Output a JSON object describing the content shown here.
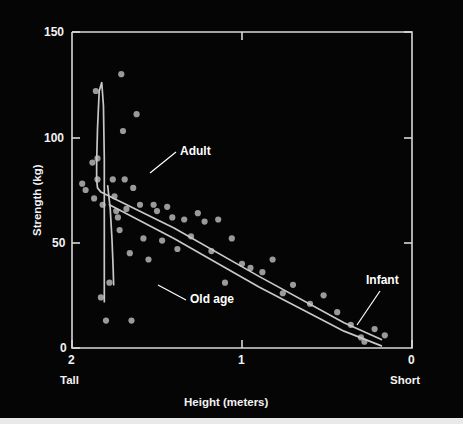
{
  "figure": {
    "background_color": "#050505",
    "ink_color": "#d8d8d8",
    "point_color": "#9a9a9a",
    "label_color": "#ffffff"
  },
  "axes": {
    "y_title": "Strength (kg)",
    "x_title": "Height (meters)",
    "y_ticks": [
      "0",
      "50",
      "100",
      "150"
    ],
    "x_ticks": [
      "2",
      "1",
      "0"
    ],
    "x_left_word": "Tall",
    "x_right_word": "Short"
  },
  "annotations": {
    "adult": "Adult",
    "old_age": "Old age",
    "infant": "Infant"
  },
  "chart_data": {
    "type": "scatter",
    "title": "",
    "xlabel": "Height (meters)",
    "ylabel": "Strength (kg)",
    "xlim": [
      2,
      0
    ],
    "ylim": [
      0,
      150
    ],
    "x_axis_reversed": true,
    "xticks": [
      2,
      1,
      0
    ],
    "yticks": [
      0,
      50,
      100,
      150
    ],
    "xtick_end_labels": {
      "left": "Tall",
      "right": "Short"
    },
    "grid": false,
    "legend": "none",
    "annotations": [
      {
        "text": "Adult",
        "x": 1.57,
        "y": 82,
        "points_to": {
          "x": 1.78,
          "y": 71
        }
      },
      {
        "text": "Old age",
        "x": 1.46,
        "y": 23,
        "points_to": {
          "x": 1.66,
          "y": 32
        }
      },
      {
        "text": "Infant",
        "x": 0.22,
        "y": 34,
        "points_to": {
          "x": 0.14,
          "y": 12
        }
      }
    ],
    "series": [
      {
        "name": "individuals",
        "type": "scatter",
        "marker_color": "#9a9a9a",
        "points": [
          {
            "x": 1.94,
            "y": 78
          },
          {
            "x": 1.92,
            "y": 75
          },
          {
            "x": 1.88,
            "y": 88
          },
          {
            "x": 1.87,
            "y": 71
          },
          {
            "x": 1.86,
            "y": 122
          },
          {
            "x": 1.85,
            "y": 90
          },
          {
            "x": 1.85,
            "y": 80
          },
          {
            "x": 1.83,
            "y": 24
          },
          {
            "x": 1.82,
            "y": 68
          },
          {
            "x": 1.8,
            "y": 13
          },
          {
            "x": 1.78,
            "y": 31
          },
          {
            "x": 1.76,
            "y": 80
          },
          {
            "x": 1.75,
            "y": 72
          },
          {
            "x": 1.74,
            "y": 65
          },
          {
            "x": 1.73,
            "y": 62
          },
          {
            "x": 1.72,
            "y": 56
          },
          {
            "x": 1.71,
            "y": 130
          },
          {
            "x": 1.7,
            "y": 103
          },
          {
            "x": 1.69,
            "y": 80
          },
          {
            "x": 1.68,
            "y": 66
          },
          {
            "x": 1.66,
            "y": 45
          },
          {
            "x": 1.65,
            "y": 13
          },
          {
            "x": 1.64,
            "y": 76
          },
          {
            "x": 1.62,
            "y": 111
          },
          {
            "x": 1.6,
            "y": 68
          },
          {
            "x": 1.58,
            "y": 52
          },
          {
            "x": 1.55,
            "y": 42
          },
          {
            "x": 1.52,
            "y": 68
          },
          {
            "x": 1.5,
            "y": 65
          },
          {
            "x": 1.47,
            "y": 51
          },
          {
            "x": 1.44,
            "y": 67
          },
          {
            "x": 1.41,
            "y": 62
          },
          {
            "x": 1.38,
            "y": 47
          },
          {
            "x": 1.34,
            "y": 61
          },
          {
            "x": 1.3,
            "y": 53
          },
          {
            "x": 1.26,
            "y": 64
          },
          {
            "x": 1.22,
            "y": 60
          },
          {
            "x": 1.18,
            "y": 46
          },
          {
            "x": 1.14,
            "y": 61
          },
          {
            "x": 1.1,
            "y": 31
          },
          {
            "x": 1.06,
            "y": 52
          },
          {
            "x": 1.0,
            "y": 40
          },
          {
            "x": 0.95,
            "y": 38
          },
          {
            "x": 0.88,
            "y": 36
          },
          {
            "x": 0.82,
            "y": 42
          },
          {
            "x": 0.76,
            "y": 26
          },
          {
            "x": 0.7,
            "y": 30
          },
          {
            "x": 0.6,
            "y": 21
          },
          {
            "x": 0.52,
            "y": 25
          },
          {
            "x": 0.44,
            "y": 17
          },
          {
            "x": 0.36,
            "y": 11
          },
          {
            "x": 0.3,
            "y": 5
          },
          {
            "x": 0.28,
            "y": 3
          },
          {
            "x": 0.22,
            "y": 9
          },
          {
            "x": 0.16,
            "y": 6
          }
        ]
      },
      {
        "name": "growth-curve-upper",
        "type": "line",
        "line_color": "#c8c8c8",
        "description": "Sharp rise near 1.80 m peaking at 126 kg then falling to the adult knee and descending band",
        "points": [
          {
            "x": 1.81,
            "y": 22
          },
          {
            "x": 1.81,
            "y": 90
          },
          {
            "x": 1.815,
            "y": 115
          },
          {
            "x": 1.825,
            "y": 126
          },
          {
            "x": 1.84,
            "y": 122
          },
          {
            "x": 1.85,
            "y": 104
          },
          {
            "x": 1.855,
            "y": 88
          },
          {
            "x": 1.855,
            "y": 80
          },
          {
            "x": 1.85,
            "y": 76
          },
          {
            "x": 1.83,
            "y": 74
          },
          {
            "x": 1.78,
            "y": 72
          },
          {
            "x": 1.4,
            "y": 57
          },
          {
            "x": 0.9,
            "y": 34
          },
          {
            "x": 0.4,
            "y": 12
          },
          {
            "x": 0.18,
            "y": 4
          }
        ]
      },
      {
        "name": "growth-curve-lower",
        "type": "line",
        "line_color": "#c8c8c8",
        "description": "Lower edge of the adult-to-infant band",
        "points": [
          {
            "x": 1.78,
            "y": 68
          },
          {
            "x": 1.4,
            "y": 52
          },
          {
            "x": 0.9,
            "y": 29
          },
          {
            "x": 0.4,
            "y": 8
          },
          {
            "x": 0.18,
            "y": 1
          }
        ]
      },
      {
        "name": "old-age-curve",
        "type": "line",
        "line_color": "#c8c8c8",
        "description": "Vertical drop from the adult knee down to old age",
        "points": [
          {
            "x": 1.79,
            "y": 77
          },
          {
            "x": 1.775,
            "y": 66
          },
          {
            "x": 1.765,
            "y": 52
          },
          {
            "x": 1.758,
            "y": 38
          },
          {
            "x": 1.755,
            "y": 30
          }
        ]
      }
    ]
  }
}
